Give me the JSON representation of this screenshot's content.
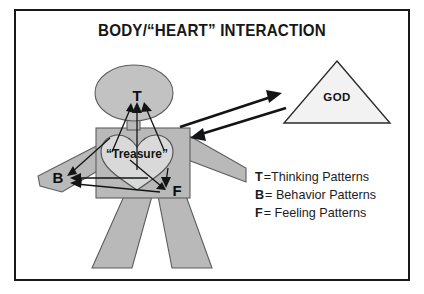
{
  "diagram": {
    "title": "BODY/“HEART” INTERACTION",
    "figure": {
      "head_label": "T",
      "arm_label": "B",
      "feeling_label": "F",
      "heart_label": "“Treasure”"
    },
    "god": {
      "label": "GOD"
    },
    "legend": [
      {
        "key": "T",
        "separator": "=",
        "description": "Thinking Patterns"
      },
      {
        "key": "B",
        "separator": "=",
        "description": "Behavior Patterns"
      },
      {
        "key": "F",
        "separator": "=",
        "description": "Feeling Patterns"
      }
    ],
    "colors": {
      "frame": "#17181a",
      "body_gray": "#b9b9b9",
      "heart_gray": "#d9d9d9",
      "triangle_gray": "#f2f2f2",
      "ink": "#131415",
      "background": "#ffffff"
    }
  }
}
